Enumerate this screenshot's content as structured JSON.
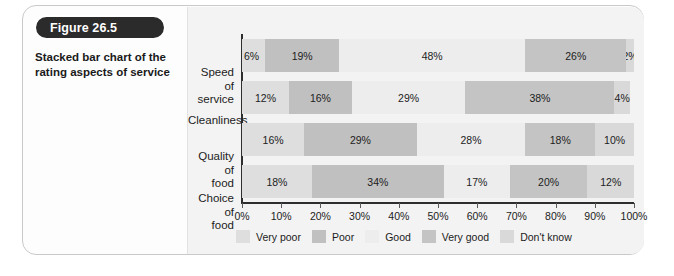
{
  "figure": {
    "badge_label": "Figure 26.5",
    "caption": "Stacked bar chart of the rating aspects of service"
  },
  "chart_data": {
    "type": "bar",
    "orientation": "horizontal",
    "stacked": true,
    "title": "",
    "xlabel": "",
    "ylabel": "",
    "xlim": [
      0,
      100
    ],
    "grid": false,
    "legend_position": "bottom",
    "categories": [
      "Speed of service",
      "Cleanliness",
      "Quality of food",
      "Choice of food"
    ],
    "tick_labels": [
      "0%",
      "10%",
      "20%",
      "30%",
      "40%",
      "50%",
      "60%",
      "70%",
      "80%",
      "90%",
      "100%"
    ],
    "tick_values": [
      0,
      10,
      20,
      30,
      40,
      50,
      60,
      70,
      80,
      90,
      100
    ],
    "series": [
      {
        "name": "Very poor",
        "color": "#dedede",
        "values": [
          6,
          12,
          16,
          18
        ]
      },
      {
        "name": "Poor",
        "color": "#c0c0c0",
        "values": [
          19,
          16,
          29,
          34
        ]
      },
      {
        "name": "Good",
        "color": "#ededed",
        "values": [
          48,
          29,
          28,
          17
        ]
      },
      {
        "name": "Very good",
        "color": "#c4c4c4",
        "values": [
          26,
          38,
          18,
          20
        ]
      },
      {
        "name": "Don't know",
        "color": "#d9d9d9",
        "values": [
          2,
          4,
          10,
          12
        ]
      }
    ],
    "data_labels": [
      [
        "6%",
        "19%",
        "48%",
        "26%",
        "2%"
      ],
      [
        "12%",
        "16%",
        "29%",
        "38%",
        "4%"
      ],
      [
        "16%",
        "29%",
        "28%",
        "18%",
        "10%"
      ],
      [
        "18%",
        "34%",
        "17%",
        "20%",
        "12%"
      ]
    ],
    "category_labels_display": [
      {
        "line1": "Speed of",
        "line2": "service"
      },
      {
        "line1": "Cleanliness",
        "line2": ""
      },
      {
        "line1": "Quality of",
        "line2": "food"
      },
      {
        "line1": "Choice of",
        "line2": "food"
      }
    ],
    "legend": [
      {
        "label": "Very poor",
        "color": "#dedede"
      },
      {
        "label": "Poor",
        "color": "#c0c0c0"
      },
      {
        "label": "Good",
        "color": "#ededed"
      },
      {
        "label": "Very good",
        "color": "#c4c4c4"
      },
      {
        "label": "Don't know",
        "color": "#d9d9d9"
      }
    ]
  }
}
